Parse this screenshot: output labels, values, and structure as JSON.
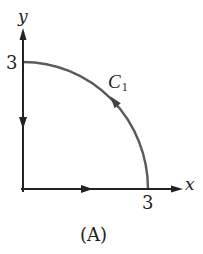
{
  "figure": {
    "caption": "(A)",
    "axes": {
      "x_label": "x",
      "y_label": "y",
      "x_tick": "3",
      "y_tick": "3"
    },
    "curve": {
      "name": "C",
      "subscript": "1",
      "description": "Closed path: from origin along x-axis to (3,0), counterclockwise along quarter circle of radius 3 to (0,3), then down the y-axis back to origin"
    },
    "colors": {
      "axis": "#222222",
      "arc": "#5a5a5a",
      "background": "#ffffff"
    }
  }
}
